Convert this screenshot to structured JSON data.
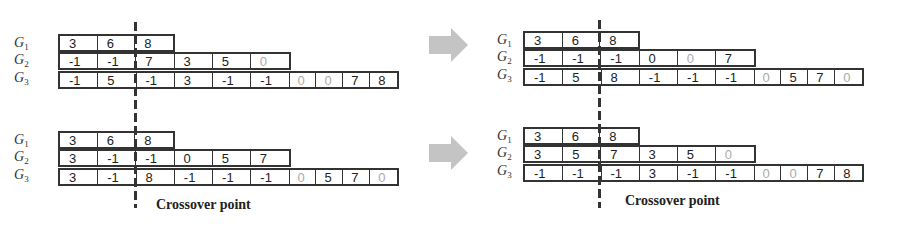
{
  "row_labels": [
    "G1",
    "G2",
    "G3"
  ],
  "caption": "Crossover point",
  "colors": {
    "line": "#333333",
    "gray_text": "#aaaaaa",
    "arrow": "#c4c4c4"
  },
  "panels": {
    "top_left": {
      "G1": [
        "3",
        "6",
        "8"
      ],
      "G2": [
        "-1",
        "-1",
        "7",
        "3",
        "5",
        "0"
      ],
      "G3": [
        "-1",
        "5",
        "-1",
        "3",
        "-1",
        "-1",
        "0",
        "0",
        "7",
        "8"
      ]
    },
    "top_right": {
      "G1": [
        "3",
        "6",
        "8"
      ],
      "G2": [
        "-1",
        "-1",
        "-1",
        "0",
        "0",
        "7"
      ],
      "G3": [
        "-1",
        "5",
        "8",
        "-1",
        "-1",
        "-1",
        "0",
        "5",
        "7",
        "0"
      ]
    },
    "bottom_left": {
      "G1": [
        "3",
        "6",
        "8"
      ],
      "G2": [
        "3",
        "-1",
        "-1",
        "0",
        "5",
        "7"
      ],
      "G3": [
        "3",
        "-1",
        "8",
        "-1",
        "-1",
        "-1",
        "0",
        "5",
        "7",
        "0"
      ]
    },
    "bottom_right": {
      "G1": [
        "3",
        "6",
        "8"
      ],
      "G2": [
        "3",
        "5",
        "7",
        "3",
        "5",
        "0"
      ],
      "G3": [
        "-1",
        "-1",
        "-1",
        "3",
        "-1",
        "-1",
        "0",
        "0",
        "7",
        "8"
      ]
    }
  }
}
